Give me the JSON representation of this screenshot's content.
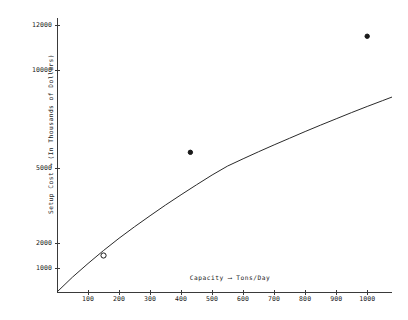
{
  "chart_data": {
    "type": "line",
    "title": "",
    "subtitle": "",
    "xlabel": "Capacity  ⟶  Tons/Day",
    "xlabel_text": "Capacity",
    "xlabel_arrow": "⟶",
    "xlabel_units": "Tons/Day",
    "ylabel": "Setup Cost  ⟶  (In Thousands of Dollars)",
    "ylabel_text": "Setup Cost",
    "ylabel_arrow": "⟶",
    "ylabel_units": "(In Thousands of Dollars)",
    "xlim": [
      0,
      1080
    ],
    "ylim": [
      0,
      12800
    ],
    "grid": false,
    "legend": null,
    "x_ticks": [
      100,
      200,
      300,
      400,
      500,
      600,
      700,
      800,
      900,
      1000
    ],
    "x_tick_labels": [
      "100",
      "200",
      "300",
      "400",
      "500",
      "600",
      "700",
      "800",
      "900",
      "1000"
    ],
    "y_ticks": [
      1000,
      2000,
      5000,
      10000,
      12000
    ],
    "y_tick_labels": [
      "1000",
      "2000",
      "5000",
      "10000",
      "12000"
    ],
    "y_scale": "non-linear",
    "series": [
      {
        "name": "Setup cost curve",
        "type": "line",
        "x": [
          0,
          50,
          100,
          150,
          200,
          250,
          300,
          350,
          400,
          450,
          500,
          550,
          600,
          650,
          700,
          750,
          800,
          850,
          900,
          950,
          1000,
          1050,
          1080
        ],
        "y": [
          0,
          620,
          1180,
          1700,
          2190,
          2650,
          3090,
          3520,
          3930,
          4330,
          4720,
          5100,
          5470,
          5830,
          6180,
          6520,
          6860,
          7190,
          7510,
          7830,
          8140,
          8440,
          8620
        ]
      },
      {
        "name": "Observed data points",
        "type": "scatter",
        "points": [
          {
            "x": 150,
            "y": 1500,
            "marker": "open-circle"
          },
          {
            "x": 430,
            "y": 5800,
            "marker": "filled-circle"
          },
          {
            "x": 1000,
            "y": 11500,
            "marker": "filled-circle"
          }
        ]
      }
    ],
    "annotations": []
  },
  "axes": {
    "y_title": "Setup Cost ⟶ (In Thousands of Dollars)",
    "x_title": "Capacity ⟶ Tons/Day"
  }
}
